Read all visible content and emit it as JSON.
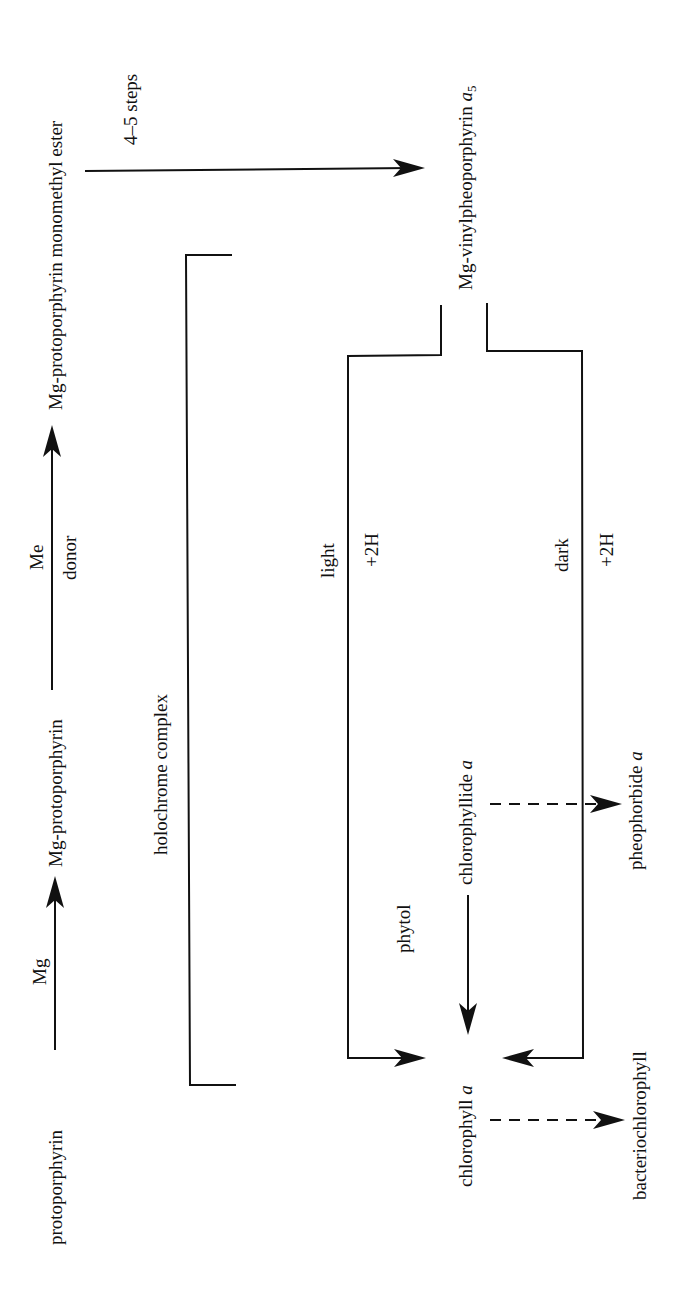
{
  "diagram": {
    "orientation": "rotated 90 degrees counter-clockwise",
    "nodes": {
      "protoporphyrin": "protoporphyrin",
      "mg_protoporphyrin": "Mg-protoporphyrin",
      "mg_proto_monomethyl_ester": "Mg-protoporphyrin monomethyl ester",
      "mg_vinylpheoporphyrin": "Mg-vinylpheoporphyrin ",
      "mg_vinylpheoporphyrin_italic": "a",
      "mg_vinylpheoporphyrin_sub": "5",
      "chlorophyllide": "chlorophyllide ",
      "chlorophyllide_italic": "a",
      "chlorophyll": "chlorophyll ",
      "chlorophyll_italic": "a",
      "pheophorbide": "pheophorbide ",
      "pheophorbide_italic": "a",
      "bacteriochlorophyll": "bacteriochlorophyll"
    },
    "edge_labels": {
      "mg": "Mg",
      "me": "Me",
      "donor": "donor",
      "steps": "4–5 steps",
      "light": "light",
      "light_h": "+2H",
      "dark": "dark",
      "dark_h": "+2H",
      "phytol": "phytol",
      "holochrome": "holochrome complex"
    },
    "edges": [
      {
        "from": "protoporphyrin",
        "to": "Mg-protoporphyrin",
        "label": "Mg",
        "style": "solid"
      },
      {
        "from": "Mg-protoporphyrin",
        "to": "Mg-protoporphyrin monomethyl ester",
        "label": "Me donor",
        "style": "solid"
      },
      {
        "from": "Mg-protoporphyrin monomethyl ester",
        "to": "Mg-vinylpheoporphyrin a5",
        "label": "4–5 steps",
        "style": "solid"
      },
      {
        "from": "Mg-vinylpheoporphyrin a5",
        "to": "chlorophyllide a",
        "label": "light +2H",
        "style": "solid"
      },
      {
        "from": "Mg-vinylpheoporphyrin a5",
        "to": "chlorophyllide a",
        "label": "dark +2H",
        "style": "solid"
      },
      {
        "from": "chlorophyllide a",
        "to": "chlorophyll a",
        "label": "phytol",
        "style": "solid"
      },
      {
        "from": "chlorophyllide a",
        "to": "pheophorbide a",
        "label": "",
        "style": "dashed"
      },
      {
        "from": "chlorophyll a",
        "to": "bacteriochlorophyll",
        "label": "",
        "style": "dashed"
      }
    ]
  }
}
